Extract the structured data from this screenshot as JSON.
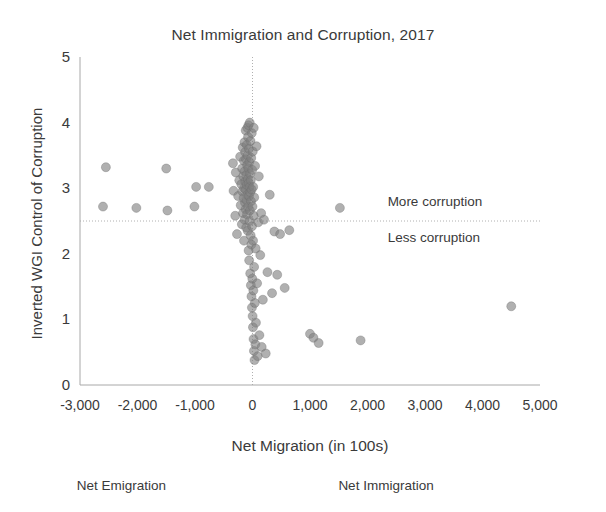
{
  "chart_data": {
    "type": "scatter",
    "title": "Net Immigration and Corruption, 2017",
    "xlabel": "Net Migration (in 100s)",
    "ylabel": "Inverted WGI Control of Corruption",
    "xlim": [
      -3000,
      5000
    ],
    "ylim": [
      0,
      5
    ],
    "xticks": [
      -3000,
      -2000,
      -1000,
      0,
      1000,
      2000,
      3000,
      4000,
      5000
    ],
    "xticklabels": [
      "-3,000",
      "-2,000",
      "-1,000",
      "0",
      "1,000",
      "2,000",
      "3,000",
      "4,000",
      "5,000"
    ],
    "yticks": [
      0,
      1,
      2,
      3,
      4,
      5
    ],
    "yticklabels": [
      "0",
      "1",
      "2",
      "3",
      "4",
      "5"
    ],
    "grid": false,
    "legend": "none",
    "marker": {
      "shape": "circle",
      "color": "#808080",
      "opacity": 0.62,
      "size": 9,
      "edge_color": "#6e6e6e"
    },
    "reference_lines": [
      {
        "name": "horizontal-midline",
        "orientation": "horizontal",
        "value": 2.5,
        "style": "dotted",
        "color": "#b0b0b0"
      },
      {
        "name": "vertical-zero-line",
        "orientation": "vertical",
        "value": 0,
        "style": "dotted",
        "color": "#b0b0b0"
      }
    ],
    "annotations": [
      {
        "name": "more-corruption-note",
        "text": "More corruption",
        "x": 2350,
        "y": 2.78
      },
      {
        "name": "less-corruption-note",
        "text": "Less corruption",
        "x": 2350,
        "y": 2.22
      },
      {
        "name": "net-emigration-note",
        "text": "Net Emigration",
        "x": -2100,
        "y": -0.78
      },
      {
        "name": "net-immigration-note",
        "text": "Net Immigration",
        "x": 2450,
        "y": -0.78
      }
    ],
    "points": [
      {
        "x": -2550,
        "y": 3.32
      },
      {
        "x": -2600,
        "y": 2.72
      },
      {
        "x": -2020,
        "y": 2.7
      },
      {
        "x": -1500,
        "y": 3.3
      },
      {
        "x": -1480,
        "y": 2.66
      },
      {
        "x": -1010,
        "y": 2.72
      },
      {
        "x": -980,
        "y": 3.02
      },
      {
        "x": -760,
        "y": 3.02
      },
      {
        "x": -340,
        "y": 3.38
      },
      {
        "x": -330,
        "y": 2.96
      },
      {
        "x": -300,
        "y": 2.58
      },
      {
        "x": -290,
        "y": 3.24
      },
      {
        "x": -270,
        "y": 2.3
      },
      {
        "x": -250,
        "y": 2.88
      },
      {
        "x": -230,
        "y": 3.12
      },
      {
        "x": -215,
        "y": 3.48
      },
      {
        "x": -205,
        "y": 2.74
      },
      {
        "x": -195,
        "y": 3.06
      },
      {
        "x": -185,
        "y": 2.45
      },
      {
        "x": -180,
        "y": 3.3
      },
      {
        "x": -175,
        "y": 2.95
      },
      {
        "x": -170,
        "y": 3.62
      },
      {
        "x": -165,
        "y": 2.62
      },
      {
        "x": -160,
        "y": 3.18
      },
      {
        "x": -155,
        "y": 2.85
      },
      {
        "x": -150,
        "y": 3.42
      },
      {
        "x": -148,
        "y": 2.2
      },
      {
        "x": -145,
        "y": 3.0
      },
      {
        "x": -140,
        "y": 3.7
      },
      {
        "x": -138,
        "y": 2.52
      },
      {
        "x": -135,
        "y": 3.26
      },
      {
        "x": -130,
        "y": 2.78
      },
      {
        "x": -128,
        "y": 3.55
      },
      {
        "x": -125,
        "y": 3.1
      },
      {
        "x": -120,
        "y": 2.68
      },
      {
        "x": -118,
        "y": 3.88
      },
      {
        "x": -115,
        "y": 2.98
      },
      {
        "x": -112,
        "y": 3.44
      },
      {
        "x": -110,
        "y": 2.4
      },
      {
        "x": -108,
        "y": 3.2
      },
      {
        "x": -105,
        "y": 2.82
      },
      {
        "x": -100,
        "y": 3.66
      },
      {
        "x": -98,
        "y": 3.05
      },
      {
        "x": -95,
        "y": 2.6
      },
      {
        "x": -92,
        "y": 3.35
      },
      {
        "x": -90,
        "y": 3.92
      },
      {
        "x": -88,
        "y": 2.9
      },
      {
        "x": -85,
        "y": 3.5
      },
      {
        "x": -82,
        "y": 2.35
      },
      {
        "x": -80,
        "y": 3.14
      },
      {
        "x": -78,
        "y": 3.78
      },
      {
        "x": -75,
        "y": 2.72
      },
      {
        "x": -72,
        "y": 3.3
      },
      {
        "x": -70,
        "y": 3.96
      },
      {
        "x": -68,
        "y": 2.05
      },
      {
        "x": -65,
        "y": 3.08
      },
      {
        "x": -62,
        "y": 3.6
      },
      {
        "x": -60,
        "y": 2.88
      },
      {
        "x": -58,
        "y": 1.9
      },
      {
        "x": -55,
        "y": 3.4
      },
      {
        "x": -52,
        "y": 2.5
      },
      {
        "x": -50,
        "y": 3.02
      },
      {
        "x": -48,
        "y": 4.0
      },
      {
        "x": -45,
        "y": 2.66
      },
      {
        "x": -42,
        "y": 3.22
      },
      {
        "x": -40,
        "y": 1.7
      },
      {
        "x": -38,
        "y": 2.94
      },
      {
        "x": -35,
        "y": 3.72
      },
      {
        "x": -32,
        "y": 2.28
      },
      {
        "x": -30,
        "y": 3.12
      },
      {
        "x": -28,
        "y": 1.52
      },
      {
        "x": -25,
        "y": 2.8
      },
      {
        "x": -22,
        "y": 3.46
      },
      {
        "x": -20,
        "y": 2.14
      },
      {
        "x": -18,
        "y": 1.35
      },
      {
        "x": -15,
        "y": 2.98
      },
      {
        "x": -12,
        "y": 3.84
      },
      {
        "x": -10,
        "y": 1.18
      },
      {
        "x": -8,
        "y": 2.42
      },
      {
        "x": -5,
        "y": 3.28
      },
      {
        "x": -3,
        "y": 1.62
      },
      {
        "x": 0,
        "y": 2.72
      },
      {
        "x": 2,
        "y": 1.05
      },
      {
        "x": 5,
        "y": 3.56
      },
      {
        "x": 8,
        "y": 0.88
      },
      {
        "x": 10,
        "y": 2.2
      },
      {
        "x": 12,
        "y": 3.02
      },
      {
        "x": 15,
        "y": 1.44
      },
      {
        "x": 18,
        "y": 0.7
      },
      {
        "x": 20,
        "y": 2.58
      },
      {
        "x": 22,
        "y": 3.92
      },
      {
        "x": 25,
        "y": 0.52
      },
      {
        "x": 28,
        "y": 1.8
      },
      {
        "x": 30,
        "y": 2.86
      },
      {
        "x": 35,
        "y": 0.38
      },
      {
        "x": 40,
        "y": 1.25
      },
      {
        "x": 45,
        "y": 3.34
      },
      {
        "x": 50,
        "y": 0.62
      },
      {
        "x": 55,
        "y": 2.08
      },
      {
        "x": 60,
        "y": 0.95
      },
      {
        "x": 70,
        "y": 3.64
      },
      {
        "x": 80,
        "y": 1.55
      },
      {
        "x": 90,
        "y": 0.44
      },
      {
        "x": 100,
        "y": 2.48
      },
      {
        "x": 110,
        "y": 3.18
      },
      {
        "x": 120,
        "y": 0.76
      },
      {
        "x": 135,
        "y": 1.98
      },
      {
        "x": 150,
        "y": 2.62
      },
      {
        "x": 160,
        "y": 0.58
      },
      {
        "x": 180,
        "y": 1.3
      },
      {
        "x": 200,
        "y": 2.52
      },
      {
        "x": 230,
        "y": 0.48
      },
      {
        "x": 260,
        "y": 1.72
      },
      {
        "x": 300,
        "y": 2.9
      },
      {
        "x": 340,
        "y": 1.4
      },
      {
        "x": 380,
        "y": 2.34
      },
      {
        "x": 430,
        "y": 1.68
      },
      {
        "x": 480,
        "y": 2.3
      },
      {
        "x": 560,
        "y": 1.48
      },
      {
        "x": 640,
        "y": 2.36
      },
      {
        "x": 1000,
        "y": 0.78
      },
      {
        "x": 1060,
        "y": 0.72
      },
      {
        "x": 1150,
        "y": 0.64
      },
      {
        "x": 1520,
        "y": 2.7
      },
      {
        "x": 1880,
        "y": 0.68
      },
      {
        "x": 4500,
        "y": 1.2
      }
    ]
  }
}
